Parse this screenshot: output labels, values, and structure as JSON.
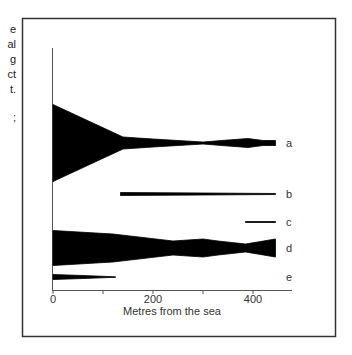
{
  "side_text_fragments": [
    "e",
    "al",
    "g",
    "ct",
    "t.",
    ";"
  ],
  "chart_data": {
    "type": "area",
    "subtype": "kite-diagram",
    "title": "",
    "xlabel": "Metres from the sea",
    "ylabel": "",
    "xlim": [
      0,
      470
    ],
    "xticks": [
      0,
      100,
      200,
      300,
      400
    ],
    "xtick_labels": [
      "0",
      "200",
      "400"
    ],
    "xtick_labeled_values": [
      0,
      200,
      400
    ],
    "grid": false,
    "legend": "none",
    "series": [
      {
        "name": "a",
        "points": [
          [
            0,
            77
          ],
          [
            140,
            12
          ],
          [
            200,
            8
          ],
          [
            300,
            2
          ],
          [
            350,
            6
          ],
          [
            390,
            9
          ],
          [
            420,
            5
          ],
          [
            445,
            5
          ]
        ]
      },
      {
        "name": "b",
        "points": [
          [
            135,
            3
          ],
          [
            300,
            2
          ],
          [
            445,
            1
          ]
        ]
      },
      {
        "name": "c",
        "points": [
          [
            385,
            1
          ],
          [
            445,
            1
          ]
        ]
      },
      {
        "name": "d",
        "points": [
          [
            0,
            35
          ],
          [
            120,
            28
          ],
          [
            240,
            14
          ],
          [
            300,
            18
          ],
          [
            330,
            14
          ],
          [
            385,
            8
          ],
          [
            445,
            18
          ]
        ]
      },
      {
        "name": "e",
        "points": [
          [
            0,
            5
          ],
          [
            60,
            3
          ],
          [
            125,
            0.5
          ]
        ]
      }
    ],
    "color": "#000000"
  }
}
